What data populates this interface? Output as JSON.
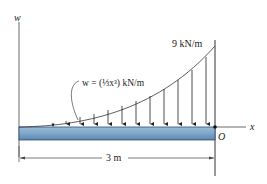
{
  "diagram": {
    "axis_w_label": "w",
    "axis_x_label": "x",
    "origin_label": "O",
    "max_load_label": "9 kN/m",
    "load_function_label": "w = (⅓x³) kN/m",
    "span_label": "3 m",
    "colors": {
      "beam_fill": "#7fa6c9",
      "beam_dark": "#4b78a3",
      "line": "#2a2a2a"
    }
  }
}
